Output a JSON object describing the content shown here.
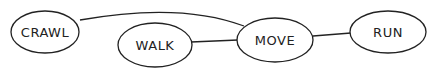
{
  "diagram": {
    "type": "concept-map",
    "nodes": [
      {
        "id": "crawl",
        "label": "CRAWL",
        "cx": 45,
        "cy": 32,
        "rx": 34,
        "ry": 21
      },
      {
        "id": "walk",
        "label": "WALK",
        "cx": 155,
        "cy": 45,
        "rx": 37,
        "ry": 22
      },
      {
        "id": "move",
        "label": "MOVE",
        "cx": 275,
        "cy": 40,
        "rx": 38,
        "ry": 22
      },
      {
        "id": "run",
        "label": "RUN",
        "cx": 388,
        "cy": 32,
        "rx": 38,
        "ry": 21
      }
    ],
    "edges": [
      {
        "from": "crawl",
        "to": "move"
      },
      {
        "from": "walk",
        "to": "move"
      },
      {
        "from": "move",
        "to": "run"
      }
    ],
    "stroke_color": "#222222"
  }
}
